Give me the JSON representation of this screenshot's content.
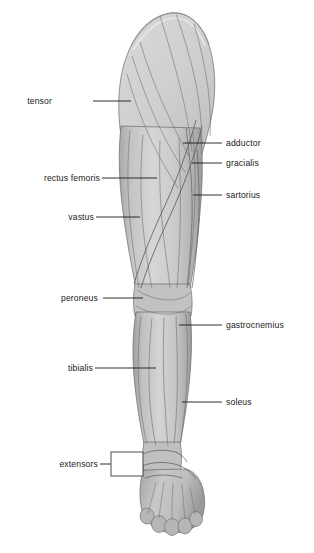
{
  "figure": {
    "view": "anterior",
    "background_color": "#ffffff",
    "ink_color": "#1a1a1a",
    "skin_base_color": "#c9c9c9",
    "skin_light_color": "#dedede",
    "skin_shadow_color": "#9b9b9b",
    "outline_color": "#4a4a4a"
  },
  "labels_left": [
    {
      "name": "tensor",
      "text": "tensor",
      "text_x": 52,
      "text_y": 104,
      "line_x1": 93,
      "line_x2": 131,
      "line_y": 101
    },
    {
      "name": "rectus-femoris",
      "text": "rectus femoris",
      "text_x": 19,
      "text_y": 181,
      "line_x1": 100,
      "line_x2": 157,
      "line_y": 178
    },
    {
      "name": "vastus",
      "text": "vastus",
      "text_x": 55,
      "text_y": 220,
      "line_x1": 94,
      "line_x2": 140,
      "line_y": 217
    },
    {
      "name": "peroneus",
      "text": "peroneus",
      "text_x": 42,
      "text_y": 301,
      "line_x1": 98,
      "line_x2": 143,
      "line_y": 298
    },
    {
      "name": "tibialis",
      "text": "tibialis",
      "text_x": 55,
      "text_y": 371,
      "line_x1": 93,
      "line_x2": 156,
      "line_y": 368
    },
    {
      "name": "extensors",
      "text": "extensors",
      "text_x": 44,
      "text_y": 467,
      "line_x1": 100,
      "line_x2": 111,
      "line_y": 464
    }
  ],
  "labels_right": [
    {
      "name": "adductor",
      "text": "adductor",
      "text_x": 226,
      "text_y": 146,
      "line_x1": 183,
      "line_x2": 222,
      "line_y": 143
    },
    {
      "name": "gracialis",
      "text": "gracialis",
      "text_x": 226,
      "text_y": 166,
      "line_x1": 192,
      "line_x2": 222,
      "line_y": 163
    },
    {
      "name": "sartorius",
      "text": "sartorius",
      "text_x": 226,
      "text_y": 198,
      "line_x1": 193,
      "line_x2": 222,
      "line_y": 195
    },
    {
      "name": "gastrocnemius",
      "text": "gastrocnemius",
      "text_x": 226,
      "text_y": 328,
      "line_x1": 179,
      "line_x2": 222,
      "line_y": 325
    },
    {
      "name": "soleus",
      "text": "soleus",
      "text_x": 226,
      "text_y": 405,
      "line_x1": 182,
      "line_x2": 222,
      "line_y": 402
    }
  ],
  "callout": {
    "name": "extensors-callout-box",
    "x": 111,
    "y": 452,
    "width": 32,
    "height": 24
  }
}
